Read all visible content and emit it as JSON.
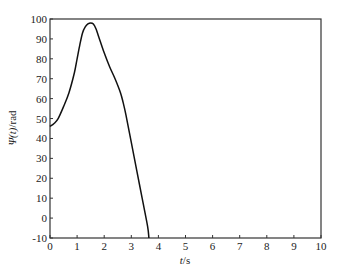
{
  "chart_data": {
    "type": "line",
    "title": "",
    "xlabel": "t/s",
    "ylabel": "Ψ(t)/rad",
    "xlim": [
      0,
      10
    ],
    "ylim": [
      -10,
      100
    ],
    "grid": false,
    "legend": null,
    "x_ticks": [
      0,
      1,
      2,
      3,
      4,
      5,
      6,
      7,
      8,
      9,
      10
    ],
    "y_ticks": [
      -10,
      0,
      10,
      20,
      30,
      40,
      50,
      60,
      70,
      80,
      90,
      100
    ],
    "series": [
      {
        "name": "Ψ(t)",
        "color": "#111111",
        "x": [
          0,
          0.15,
          0.3,
          0.5,
          0.7,
          0.9,
          1.0,
          1.1,
          1.2,
          1.3,
          1.4,
          1.5,
          1.6,
          1.7,
          1.8,
          2.0,
          2.2,
          2.4,
          2.6,
          2.7,
          2.8,
          3.0,
          3.2,
          3.4,
          3.6,
          3.65
        ],
        "values": [
          46,
          47.5,
          50,
          56,
          63,
          73,
          80,
          87,
          93,
          96,
          97.5,
          98,
          97.5,
          95,
          91,
          83,
          76,
          70,
          63,
          58,
          52,
          38,
          24,
          10,
          -4,
          -10
        ]
      }
    ]
  },
  "axes": {
    "xlabel_italic": "t",
    "xlabel_unit": "/s",
    "ylabel_symbol": "Ψ",
    "ylabel_arg": "(t)",
    "ylabel_unit": "/rad"
  }
}
